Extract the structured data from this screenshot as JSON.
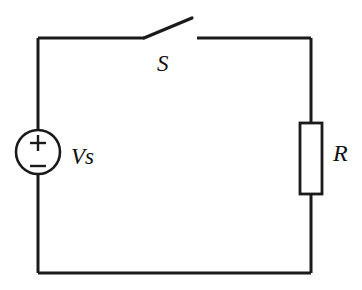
{
  "figure": {
    "kind": "schematic-circuit-diagram",
    "background_color": "#ffffff",
    "line_color": "#1a1a1a",
    "width": 362,
    "height": 290
  },
  "components": {
    "voltage_source": {
      "label": "Vs",
      "symbol": "dc-voltage-source-circle",
      "plus_sign": "+",
      "minus_sign": "−",
      "center_x": 38,
      "center_y": 152,
      "radius": 22
    },
    "switch": {
      "label": "S",
      "symbol": "spst-switch-open",
      "state": "open",
      "pivot_x": 144,
      "pivot_y": 38,
      "blade_tip_x": 192,
      "blade_tip_y": 18,
      "contact_x": 197
    },
    "resistor": {
      "label": "R",
      "symbol": "resistor-rectangle-iec",
      "x": 300,
      "y": 123,
      "width": 22,
      "height": 71
    }
  },
  "wires": {
    "loop_left_x": 38,
    "loop_right_x": 311,
    "loop_top_y": 38,
    "loop_bottom_y": 273
  }
}
